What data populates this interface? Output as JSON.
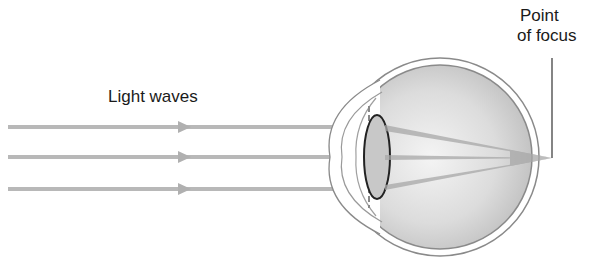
{
  "diagram": {
    "labels": {
      "light_waves": "Light waves",
      "point_of_focus_line1": "Point",
      "point_of_focus_line2": "of focus"
    },
    "rays": [
      {
        "name": "top-ray",
        "y": 127
      },
      {
        "name": "middle-ray",
        "y": 157
      },
      {
        "name": "bottom-ray",
        "y": 189
      }
    ],
    "focus_point": {
      "x": 552,
      "y": 158
    },
    "colors": {
      "ray": "#b8b8b8",
      "eye_fill": "#d8d8d8",
      "outline": "#7a7a7a",
      "lens": "#c4c4c4",
      "text": "#1a1a1a"
    }
  }
}
